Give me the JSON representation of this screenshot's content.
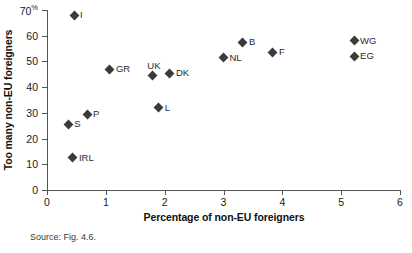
{
  "chart_data": {
    "type": "scatter",
    "title": "",
    "xlabel": "Percentage of non-EU foreigners",
    "ylabel": "Too many non-EU foreigners",
    "y_unit": "%",
    "xlim": [
      0,
      6
    ],
    "ylim": [
      0,
      70
    ],
    "xticks": [
      0,
      1,
      2,
      3,
      4,
      5,
      6
    ],
    "yticks": [
      0,
      10,
      20,
      30,
      40,
      50,
      60,
      70
    ],
    "xticklabels": [
      "0",
      "1",
      "2",
      "3",
      "4",
      "5",
      "6"
    ],
    "yticklabels": [
      "0",
      "10",
      "20",
      "30",
      "40",
      "50",
      "60",
      "70"
    ],
    "grid": false,
    "legend": "none",
    "marker": "diamond",
    "marker_color": "#3b3b3b",
    "points": [
      {
        "label": "I",
        "x": 0.46,
        "y": 68.0,
        "label_pos": "right"
      },
      {
        "label": "S",
        "x": 0.36,
        "y": 25.5,
        "label_pos": "right"
      },
      {
        "label": "IRL",
        "x": 0.44,
        "y": 12.5,
        "label_pos": "right"
      },
      {
        "label": "P",
        "x": 0.68,
        "y": 29.5,
        "label_pos": "right"
      },
      {
        "label": "GR",
        "x": 1.07,
        "y": 47.0,
        "label_pos": "right"
      },
      {
        "label": "UK",
        "x": 1.79,
        "y": 44.5,
        "label_pos": "above"
      },
      {
        "label": "L",
        "x": 1.9,
        "y": 32.0,
        "label_pos": "right"
      },
      {
        "label": "DK",
        "x": 2.09,
        "y": 45.5,
        "label_pos": "right"
      },
      {
        "label": "NL",
        "x": 3.0,
        "y": 51.5,
        "label_pos": "right"
      },
      {
        "label": "B",
        "x": 3.33,
        "y": 57.5,
        "label_pos": "right"
      },
      {
        "label": "F",
        "x": 3.84,
        "y": 53.5,
        "label_pos": "right"
      },
      {
        "label": "WG",
        "x": 5.22,
        "y": 58.0,
        "label_pos": "right"
      },
      {
        "label": "EG",
        "x": 5.22,
        "y": 52.0,
        "label_pos": "right"
      }
    ]
  },
  "source_note": "Source: Fig. 4.6."
}
